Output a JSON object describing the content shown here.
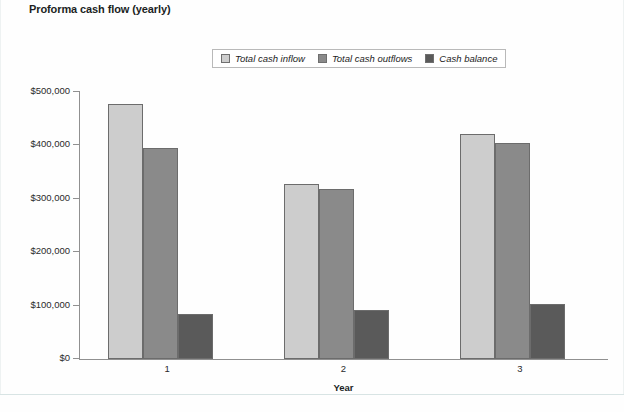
{
  "chart_data": {
    "type": "bar",
    "title": "Proforma cash flow (yearly)",
    "xlabel": "Year",
    "ylabel": "",
    "categories": [
      "1",
      "2",
      "3"
    ],
    "series": [
      {
        "name": "Total cash inflow",
        "values": [
          477000,
          327000,
          421000
        ],
        "color": "#cdcdcd"
      },
      {
        "name": "Total cash outflows",
        "values": [
          396000,
          319000,
          405000
        ],
        "color": "#8a8a8a"
      },
      {
        "name": "Cash balance",
        "values": [
          84000,
          92000,
          103000
        ],
        "color": "#5a5a5a"
      }
    ],
    "ylim": [
      0,
      500000
    ],
    "yticks": [
      0,
      100000,
      200000,
      300000,
      400000,
      500000
    ],
    "ytick_labels": [
      "$0",
      "$100,000",
      "$200,000",
      "$300,000",
      "$400,000",
      "$500,000"
    ],
    "grid": false,
    "legend_position": "top-center"
  }
}
